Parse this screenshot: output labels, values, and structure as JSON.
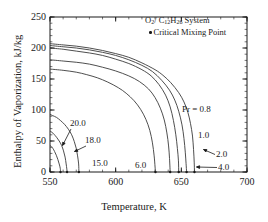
{
  "chart_data": {
    "type": "line",
    "title": "",
    "xlabel": "Temperature, K",
    "ylabel": "Enthalpy of Vaporization, kJ/kg",
    "xlim": [
      550,
      700
    ],
    "ylim": [
      0,
      250
    ],
    "xticks": [
      550,
      600,
      650,
      700
    ],
    "yticks": [
      0,
      50,
      100,
      150,
      200,
      250
    ],
    "x_minor_per_major": 5,
    "y_minor_per_major": 5,
    "grid": false,
    "legend_position": "top-right",
    "annotations": [
      "O2/ C12H26 System",
      "Critical Mixing Point"
    ],
    "series": [
      {
        "name": "Pr = 0.8",
        "label": "Pr = 0.8",
        "points": [
          [
            550,
            207
          ],
          [
            560,
            205
          ],
          [
            570,
            203
          ],
          [
            580,
            200
          ],
          [
            590,
            196
          ],
          [
            600,
            191
          ],
          [
            610,
            185
          ],
          [
            620,
            176
          ],
          [
            630,
            165
          ],
          [
            636,
            156
          ],
          [
            642,
            144
          ],
          [
            648,
            128
          ],
          [
            652,
            113
          ],
          [
            655,
            96
          ],
          [
            657,
            78
          ],
          [
            658.5,
            58
          ],
          [
            659.3,
            36
          ],
          [
            659.8,
            16
          ],
          [
            660,
            0
          ]
        ],
        "critical_mixing_point": [
          660,
          0
        ]
      },
      {
        "name": "Pr = 1.0",
        "label": "1.0",
        "points": [
          [
            550,
            204
          ],
          [
            560,
            202
          ],
          [
            570,
            200
          ],
          [
            580,
            197
          ],
          [
            590,
            193
          ],
          [
            600,
            188
          ],
          [
            610,
            181
          ],
          [
            620,
            172
          ],
          [
            628,
            162
          ],
          [
            635,
            148
          ],
          [
            641,
            132
          ],
          [
            645,
            116
          ],
          [
            648,
            98
          ],
          [
            650.5,
            76
          ],
          [
            652,
            54
          ],
          [
            653,
            32
          ],
          [
            653.6,
            14
          ],
          [
            654,
            0
          ]
        ],
        "critical_mixing_point": [
          654,
          0
        ]
      },
      {
        "name": "Pr = 2.0",
        "label": "2.0",
        "points": [
          [
            550,
            200
          ],
          [
            560,
            198
          ],
          [
            570,
            195
          ],
          [
            580,
            192
          ],
          [
            590,
            188
          ],
          [
            600,
            182
          ],
          [
            610,
            175
          ],
          [
            620,
            165
          ],
          [
            627,
            155
          ],
          [
            633,
            141
          ],
          [
            638,
            124
          ],
          [
            641.5,
            105
          ],
          [
            644,
            83
          ],
          [
            645.8,
            60
          ],
          [
            647,
            38
          ],
          [
            647.8,
            18
          ],
          [
            648,
            0
          ]
        ],
        "critical_mixing_point": [
          648,
          0
        ]
      },
      {
        "name": "Pr = 4.0",
        "label": "4.0",
        "points": [
          [
            550,
            181
          ],
          [
            560,
            179
          ],
          [
            570,
            177
          ],
          [
            580,
            174
          ],
          [
            590,
            169
          ],
          [
            600,
            163
          ],
          [
            610,
            155
          ],
          [
            618,
            146
          ],
          [
            625,
            134
          ],
          [
            630,
            120
          ],
          [
            634,
            103
          ],
          [
            637,
            84
          ],
          [
            639,
            63
          ],
          [
            640.3,
            42
          ],
          [
            641,
            22
          ],
          [
            641.5,
            0
          ]
        ],
        "critical_mixing_point": [
          641.5,
          0
        ]
      },
      {
        "name": "Pr = 6.0",
        "label": "6.0",
        "points": [
          [
            550,
            166
          ],
          [
            560,
            164
          ],
          [
            570,
            161
          ],
          [
            578,
            157
          ],
          [
            586,
            152
          ],
          [
            594,
            145
          ],
          [
            602,
            136
          ],
          [
            608,
            127
          ],
          [
            614,
            115
          ],
          [
            619,
            101
          ],
          [
            623,
            85
          ],
          [
            626,
            67
          ],
          [
            628,
            47
          ],
          [
            629.3,
            26
          ],
          [
            630,
            8
          ],
          [
            630.3,
            0
          ]
        ],
        "critical_mixing_point": [
          630.3,
          0
        ]
      },
      {
        "name": "Pr = 15.0",
        "label": "15.0",
        "points": [
          [
            550,
            93
          ],
          [
            552,
            91
          ],
          [
            555,
            88
          ],
          [
            558,
            83
          ],
          [
            561,
            77
          ],
          [
            564,
            69
          ],
          [
            566.5,
            60
          ],
          [
            568.5,
            49
          ],
          [
            570,
            38
          ],
          [
            571,
            26
          ],
          [
            571.8,
            13
          ],
          [
            572,
            0
          ]
        ],
        "critical_mixing_point": [
          572,
          0
        ]
      },
      {
        "name": "Pr = 18.0",
        "label": "18.0",
        "points": [
          [
            550,
            66
          ],
          [
            551.5,
            64
          ],
          [
            553,
            61
          ],
          [
            555,
            56
          ],
          [
            557,
            50
          ],
          [
            558.8,
            43
          ],
          [
            560.3,
            34
          ],
          [
            561.5,
            24
          ],
          [
            562.3,
            13
          ],
          [
            562.8,
            5
          ],
          [
            563,
            0
          ]
        ],
        "critical_mixing_point": [
          563,
          0
        ]
      },
      {
        "name": "Pr = 20.0",
        "label": "20.0",
        "points": [
          [
            550,
            43
          ],
          [
            551,
            41
          ],
          [
            552.2,
            38
          ],
          [
            553.5,
            33
          ],
          [
            554.8,
            27
          ],
          [
            556,
            20
          ],
          [
            557,
            13
          ],
          [
            557.8,
            6
          ],
          [
            558,
            0
          ]
        ],
        "critical_mixing_point": [
          558,
          0
        ]
      }
    ],
    "curve_label_positions": {
      "pr_08": {
        "x": 182,
        "y": 104
      },
      "pr_10": {
        "x": 198,
        "y": 130
      },
      "pr_20": {
        "x": 216,
        "y": 149
      },
      "pr_40": {
        "x": 218,
        "y": 162
      },
      "pr_60": {
        "x": 135,
        "y": 160
      },
      "pr_150": {
        "x": 92,
        "y": 158
      },
      "pr_180": {
        "x": 85,
        "y": 135
      },
      "pr_200": {
        "x": 70,
        "y": 118
      }
    }
  },
  "legend": {
    "system_label": "O",
    "system_sub1": "2",
    "system_mid": "/ C",
    "system_sub2": "12",
    "system_h": "H",
    "system_sub3": "26",
    "system_tail": " System",
    "critical_point_label": "Critical Mixing Point"
  },
  "axes": {
    "xlabel": "Temperature, K",
    "ylabel": "Enthalpy of Vaporization, kJ/kg",
    "xticks": [
      "550",
      "600",
      "650",
      "700"
    ],
    "yticks": [
      "0",
      "50",
      "100",
      "150",
      "200",
      "250"
    ]
  },
  "curve_labels": {
    "pr_08": "Pr = 0.8",
    "pr_10": "1.0",
    "pr_20": "2.0",
    "pr_40": "4.0",
    "pr_60": "6.0",
    "pr_150": "15.0",
    "pr_180": "18.0",
    "pr_200": "20.0"
  },
  "colors": {
    "axis": "#1a1a1a",
    "curve": "#3a3a3a",
    "text": "#1a1a1a",
    "background": "#ffffff"
  }
}
